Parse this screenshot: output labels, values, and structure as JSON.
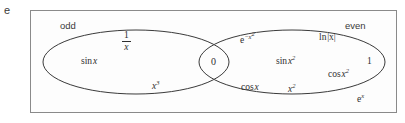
{
  "figure": {
    "part_label": "e",
    "type": "venn-diagram",
    "stroke_color": "#3a3a3a",
    "frame_color": "#8a8a8a",
    "background": "#fdfdfd"
  },
  "sets": {
    "left": {
      "name": "odd"
    },
    "right": {
      "name": "even"
    }
  },
  "members": {
    "odd_only": [
      {
        "id": "one-over-x",
        "numerator": "1",
        "denominator": "x",
        "kind": "fraction"
      },
      {
        "id": "sin-x",
        "fn": "sin",
        "arg": "x",
        "kind": "function"
      },
      {
        "id": "x-cubed",
        "base": "x",
        "exponent": "3",
        "kind": "power"
      }
    ],
    "intersection": [
      {
        "id": "zero",
        "text": "0",
        "kind": "plain"
      }
    ],
    "even_only": [
      {
        "id": "e-to-minus-x-squared",
        "base": "e",
        "exponent": "−x",
        "exponent2": "2",
        "kind": "power"
      },
      {
        "id": "ln-abs-x",
        "fn": "ln",
        "arg": "|x|",
        "kind": "function"
      },
      {
        "id": "sin-x-squared",
        "fn": "sin",
        "arg": "x",
        "exponent": "2",
        "kind": "function-power"
      },
      {
        "id": "one",
        "text": "1",
        "kind": "plain"
      },
      {
        "id": "cos-x-squared",
        "fn": "cos",
        "arg": "x",
        "exponent": "2",
        "kind": "function-power"
      },
      {
        "id": "cos-x",
        "fn": "cos",
        "arg": "x",
        "kind": "function"
      },
      {
        "id": "x-squared",
        "base": "x",
        "exponent": "2",
        "kind": "power"
      }
    ],
    "outside": [
      {
        "id": "e-to-the-x",
        "base": "e",
        "exponent": "x",
        "kind": "power"
      }
    ]
  },
  "geometry": {
    "frame": {
      "x": 30,
      "y": 10,
      "width": 367,
      "height": 103
    },
    "left_ellipse": {
      "cx": 136,
      "cy": 62,
      "rx": 93,
      "ry": 32
    },
    "right_ellipse": {
      "cx": 292,
      "cy": 62,
      "rx": 93,
      "ry": 32
    }
  }
}
